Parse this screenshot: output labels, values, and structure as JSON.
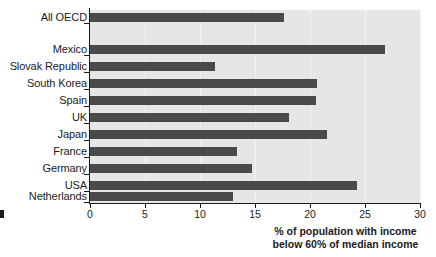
{
  "chart_data": {
    "type": "bar",
    "orientation": "horizontal",
    "title": "",
    "subtitle": "",
    "xlabel": "% of population with income\nbelow 60% of median income",
    "ylabel": "",
    "xlim": [
      0,
      30
    ],
    "xticks": [
      0,
      5,
      10,
      15,
      20,
      25,
      30
    ],
    "xtick_labels": [
      "0",
      "5",
      "10",
      "15",
      "20",
      "25",
      "30"
    ],
    "grid": true,
    "grid_axis": "x",
    "legend": false,
    "bar_color": "#4a4a4a",
    "plot_background": "#e6e6e6",
    "categories": [
      "All OECD",
      "Mexico",
      "Slovak Republic",
      "South Korea",
      "Spain",
      "UK",
      "Japan",
      "France",
      "Germany",
      "USA",
      "Netherlands"
    ],
    "values": [
      17.6,
      26.8,
      11.4,
      20.6,
      20.5,
      18.1,
      21.5,
      13.4,
      14.7,
      24.3,
      13.0
    ],
    "bars": [
      {
        "category": "All OECD",
        "value": 17.6,
        "y": 13
      },
      {
        "category": "Mexico",
        "value": 26.8,
        "y": 45
      },
      {
        "category": "Slovak Republic",
        "value": 11.4,
        "y": 62
      },
      {
        "category": "South Korea",
        "value": 20.6,
        "y": 79
      },
      {
        "category": "Spain",
        "value": 20.5,
        "y": 96
      },
      {
        "category": "UK",
        "value": 18.1,
        "y": 113
      },
      {
        "category": "Japan",
        "value": 21.5,
        "y": 130
      },
      {
        "category": "France",
        "value": 13.4,
        "y": 147
      },
      {
        "category": "Germany",
        "value": 14.7,
        "y": 164
      },
      {
        "category": "USA",
        "value": 24.3,
        "y": 181
      },
      {
        "category": "Netherlands",
        "value": 13.0,
        "y": 192
      }
    ]
  }
}
